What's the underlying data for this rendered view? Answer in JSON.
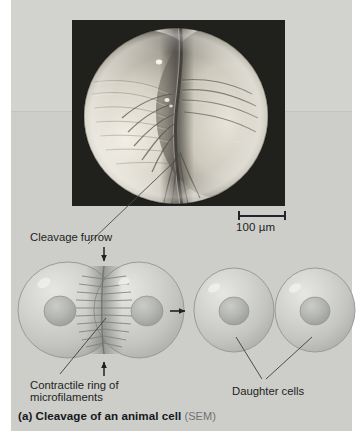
{
  "figure": {
    "caption_main": "(a) Cleavage of an animal cell",
    "caption_tag": "(SEM)",
    "background_color": "#cdcec9",
    "panel_top_tone": "#d2d3ce"
  },
  "micrograph": {
    "name": "sem-dividing-cell",
    "description": "Scanning electron micrograph of a dividing animal cell with a cleavage furrow",
    "background_color": "#1b1b1b",
    "cell_color": "#d8d5cc"
  },
  "scale_bar": {
    "label": "100 µm",
    "length_px": 48,
    "color": "#24252a"
  },
  "labels": {
    "cleavage_furrow": "Cleavage furrow",
    "contractile_ring_line1": "Contractile ring of",
    "contractile_ring_line2": "microfilaments",
    "daughter_cells": "Daughter cells"
  },
  "diagram": {
    "stage_left": {
      "name": "cleaving-cell-pair",
      "cells": 2,
      "nuclei": 2,
      "furrow": true
    },
    "stage_right": {
      "name": "daughter-cell-pair",
      "cells": 2,
      "nuclei": 2,
      "furrow": false
    },
    "arrows": {
      "furrow_top": "down",
      "furrow_bottom": "up",
      "progression": "right"
    },
    "cell_fill": "#c9cac5",
    "nucleus_fill": "#b4b6b1",
    "outline_color": "#8e8f8a"
  }
}
